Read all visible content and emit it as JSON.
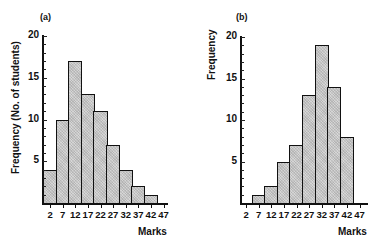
{
  "chart_data": [
    {
      "type": "bar",
      "panel": "(a)",
      "title": "",
      "xlabel": "Marks",
      "ylabel": "Frequency (No. of students)",
      "categories": [
        "2",
        "7",
        "12",
        "17",
        "22",
        "27",
        "32",
        "37",
        "42",
        "47"
      ],
      "values": [
        4,
        10,
        17,
        13,
        11,
        7,
        4,
        2,
        1,
        0
      ],
      "yticks": [
        "5",
        "10",
        "15",
        "20"
      ],
      "ylim": [
        0,
        20
      ],
      "grid": false,
      "legend": null,
      "histogram": true
    },
    {
      "type": "bar",
      "panel": "(b)",
      "title": "",
      "xlabel": "Marks",
      "ylabel": "Frequency",
      "categories": [
        "2",
        "7",
        "12",
        "17",
        "22",
        "27",
        "32",
        "37",
        "42",
        "47"
      ],
      "values": [
        0,
        1,
        2,
        5,
        7,
        13,
        19,
        14,
        8,
        0
      ],
      "yticks": [
        "5",
        "10",
        "15",
        "20"
      ],
      "ylim": [
        0,
        20
      ],
      "grid": false,
      "legend": null,
      "histogram": true
    }
  ],
  "colors": {
    "bar_fill": "#c8c8c8",
    "bar_edge": "#111111",
    "background": "#ffffff"
  }
}
